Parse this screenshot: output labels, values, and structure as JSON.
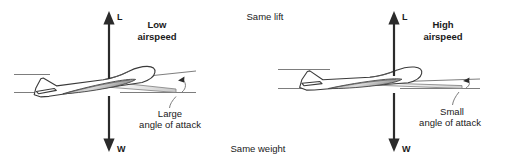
{
  "diagram": {
    "background_color": "#ffffff",
    "ink_color": "#2b2b2b",
    "center_labels": {
      "top": "Same lift",
      "bottom": "Same weight"
    },
    "panels": [
      {
        "id": "low-airspeed",
        "condition_label_line1": "Low",
        "condition_label_line2": "airspeed",
        "lift_arrow_label": "L",
        "weight_arrow_label": "W",
        "aoa_label_line1": "Large",
        "aoa_label_line2": "angle of attack",
        "aoa_degrees": 14,
        "pitch_attitude": "nose-up",
        "wedge_fill": "#d8d8d8"
      },
      {
        "id": "high-airspeed",
        "condition_label_line1": "High",
        "condition_label_line2": "airspeed",
        "lift_arrow_label": "L",
        "weight_arrow_label": "W",
        "aoa_label_line1": "Small",
        "aoa_label_line2": "angle of attack",
        "aoa_degrees": 4,
        "pitch_attitude": "near-level",
        "wedge_fill": "#d8d8d8"
      }
    ]
  }
}
